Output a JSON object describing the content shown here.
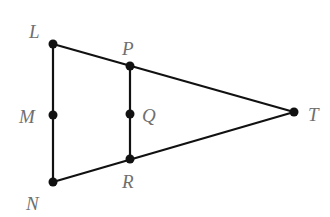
{
  "diagram": {
    "colors": {
      "line": "#111111",
      "point": "#111111",
      "label": "#6f6f6f",
      "background": "#ffffff"
    },
    "points": [
      {
        "id": "L",
        "label": "L",
        "x": 53,
        "y": 44
      },
      {
        "id": "P",
        "label": "P",
        "x": 130,
        "y": 66
      },
      {
        "id": "M",
        "label": "M",
        "x": 53,
        "y": 115
      },
      {
        "id": "Q",
        "label": "Q",
        "x": 130,
        "y": 114
      },
      {
        "id": "N",
        "label": "N",
        "x": 53,
        "y": 182
      },
      {
        "id": "R",
        "label": "R",
        "x": 130,
        "y": 159
      },
      {
        "id": "T",
        "label": "T",
        "x": 294,
        "y": 112
      }
    ],
    "segments": [
      [
        "L",
        "T"
      ],
      [
        "N",
        "T"
      ],
      [
        "L",
        "N"
      ],
      [
        "P",
        "R"
      ]
    ],
    "labels": {
      "L": "L",
      "P": "P",
      "M": "M",
      "Q": "Q",
      "N": "N",
      "R": "R",
      "T": "T"
    }
  }
}
